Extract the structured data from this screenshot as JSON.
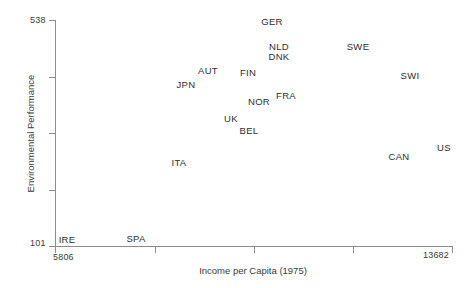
{
  "chart_data": {
    "type": "scatter",
    "title": "",
    "xlabel": "Income per Capita (1975)",
    "ylabel": "Environmental Performance",
    "xlim": [
      5806,
      13682
    ],
    "ylim": [
      101,
      538
    ],
    "x_tick_labels": [
      "5806",
      "13682"
    ],
    "y_tick_labels": [
      "538",
      "101"
    ],
    "grid": false,
    "legend": "none",
    "point_marker": "text-label",
    "points": [
      {
        "label": "GER",
        "x": 9755,
        "y": 517
      },
      {
        "label": "NLD",
        "x": 9880,
        "y": 470
      },
      {
        "label": "DNK",
        "x": 9880,
        "y": 451
      },
      {
        "label": "SWE",
        "x": 11470,
        "y": 470
      },
      {
        "label": "AUT",
        "x": 8790,
        "y": 423
      },
      {
        "label": "FIN",
        "x": 9585,
        "y": 419
      },
      {
        "label": "SWI",
        "x": 12505,
        "y": 414
      },
      {
        "label": "JPN",
        "x": 8355,
        "y": 396
      },
      {
        "label": "FRA",
        "x": 10340,
        "y": 375
      },
      {
        "label": "NOR",
        "x": 9805,
        "y": 364
      },
      {
        "label": "UK",
        "x": 9270,
        "y": 331
      },
      {
        "label": "BEL",
        "x": 9605,
        "y": 308
      },
      {
        "label": "US",
        "x": 13475,
        "y": 276
      },
      {
        "label": "CAN",
        "x": 12610,
        "y": 259
      },
      {
        "label": "ITA",
        "x": 8195,
        "y": 247
      },
      {
        "label": "SPA",
        "x": 7410,
        "y": 101
      },
      {
        "label": "IRE",
        "x": 6025,
        "y": 103
      }
    ],
    "pixel_positions": [
      {
        "label": "GER",
        "px": 272,
        "py": 21
      },
      {
        "label": "NLD",
        "px": 279,
        "py": 46
      },
      {
        "label": "DNK",
        "px": 279,
        "py": 56
      },
      {
        "label": "SWE",
        "px": 358,
        "py": 46
      },
      {
        "label": "AUT",
        "px": 208,
        "py": 70
      },
      {
        "label": "FIN",
        "px": 248,
        "py": 72
      },
      {
        "label": "SWI",
        "px": 410,
        "py": 75
      },
      {
        "label": "JPN",
        "px": 186,
        "py": 84
      },
      {
        "label": "FRA",
        "px": 286,
        "py": 95
      },
      {
        "label": "NOR",
        "px": 259,
        "py": 101
      },
      {
        "label": "UK",
        "px": 231,
        "py": 118
      },
      {
        "label": "BEL",
        "px": 249,
        "py": 130
      },
      {
        "label": "US",
        "px": 444,
        "py": 147
      },
      {
        "label": "CAN",
        "px": 399,
        "py": 156
      },
      {
        "label": "ITA",
        "px": 179,
        "py": 162
      },
      {
        "label": "SPA",
        "px": 136,
        "py": 238
      },
      {
        "label": "IRE",
        "px": 67,
        "py": 239
      }
    ],
    "y_tick_pixels": [
      20,
      77,
      133,
      190,
      246
    ],
    "x_tick_pixels": [
      55,
      155,
      254,
      353,
      452
    ],
    "axis_color": "#8c8c8c",
    "text_color": "#2e2e2e",
    "background": "#ffffff"
  }
}
